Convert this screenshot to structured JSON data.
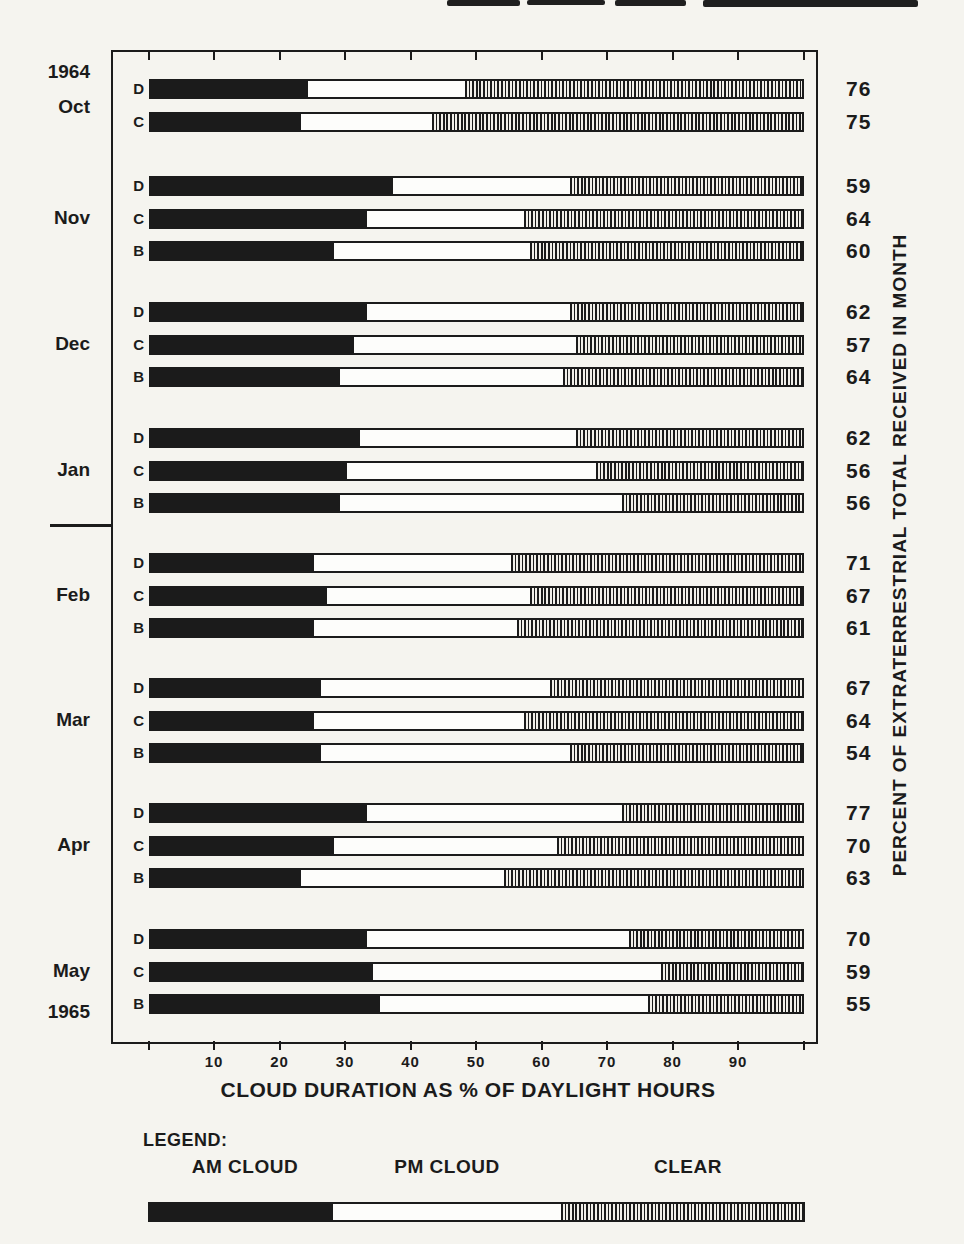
{
  "chart_data": {
    "type": "bar",
    "variant": "horizontal-stacked",
    "unit": "percent of daylight hours",
    "xlabel": "CLOUD DURATION AS % OF DAYLIGHT HOURS",
    "right_axis_label": "PERCENT OF EXTRATERRESTRIAL TOTAL RECEIVED IN MONTH",
    "xlim": [
      0,
      100
    ],
    "x_ticks": [
      10,
      20,
      30,
      40,
      50,
      60,
      70,
      80,
      90
    ],
    "segments": [
      "AM CLOUD",
      "PM CLOUD",
      "CLEAR"
    ],
    "year_start_label": "1964",
    "year_end_label": "1965",
    "groups": [
      {
        "month": "Oct",
        "bars": [
          {
            "site": "D",
            "am_cloud": 24,
            "pm_cloud": 24,
            "clear": 52,
            "percent_received": 76
          },
          {
            "site": "C",
            "am_cloud": 23,
            "pm_cloud": 20,
            "clear": 57,
            "percent_received": 75
          }
        ]
      },
      {
        "month": "Nov",
        "bars": [
          {
            "site": "D",
            "am_cloud": 37,
            "pm_cloud": 27,
            "clear": 36,
            "percent_received": 59
          },
          {
            "site": "C",
            "am_cloud": 33,
            "pm_cloud": 24,
            "clear": 43,
            "percent_received": 64
          },
          {
            "site": "B",
            "am_cloud": 28,
            "pm_cloud": 30,
            "clear": 42,
            "percent_received": 60
          }
        ]
      },
      {
        "month": "Dec",
        "bars": [
          {
            "site": "D",
            "am_cloud": 33,
            "pm_cloud": 31,
            "clear": 36,
            "percent_received": 62
          },
          {
            "site": "C",
            "am_cloud": 31,
            "pm_cloud": 34,
            "clear": 35,
            "percent_received": 57
          },
          {
            "site": "B",
            "am_cloud": 29,
            "pm_cloud": 34,
            "clear": 37,
            "percent_received": 64
          }
        ]
      },
      {
        "month": "Jan",
        "bars": [
          {
            "site": "D",
            "am_cloud": 32,
            "pm_cloud": 33,
            "clear": 35,
            "percent_received": 62
          },
          {
            "site": "C",
            "am_cloud": 30,
            "pm_cloud": 38,
            "clear": 32,
            "percent_received": 56
          },
          {
            "site": "B",
            "am_cloud": 29,
            "pm_cloud": 43,
            "clear": 28,
            "percent_received": 56
          }
        ]
      },
      {
        "month": "Feb",
        "bars": [
          {
            "site": "D",
            "am_cloud": 25,
            "pm_cloud": 30,
            "clear": 45,
            "percent_received": 71
          },
          {
            "site": "C",
            "am_cloud": 27,
            "pm_cloud": 31,
            "clear": 42,
            "percent_received": 67
          },
          {
            "site": "B",
            "am_cloud": 25,
            "pm_cloud": 31,
            "clear": 44,
            "percent_received": 61
          }
        ]
      },
      {
        "month": "Mar",
        "bars": [
          {
            "site": "D",
            "am_cloud": 26,
            "pm_cloud": 35,
            "clear": 39,
            "percent_received": 67
          },
          {
            "site": "C",
            "am_cloud": 25,
            "pm_cloud": 32,
            "clear": 43,
            "percent_received": 64
          },
          {
            "site": "B",
            "am_cloud": 26,
            "pm_cloud": 38,
            "clear": 36,
            "percent_received": 54
          }
        ]
      },
      {
        "month": "Apr",
        "bars": [
          {
            "site": "D",
            "am_cloud": 33,
            "pm_cloud": 39,
            "clear": 28,
            "percent_received": 77
          },
          {
            "site": "C",
            "am_cloud": 28,
            "pm_cloud": 34,
            "clear": 38,
            "percent_received": 70
          },
          {
            "site": "B",
            "am_cloud": 23,
            "pm_cloud": 31,
            "clear": 46,
            "percent_received": 63
          }
        ]
      },
      {
        "month": "May",
        "bars": [
          {
            "site": "D",
            "am_cloud": 33,
            "pm_cloud": 40,
            "clear": 27,
            "percent_received": 70
          },
          {
            "site": "C",
            "am_cloud": 34,
            "pm_cloud": 44,
            "clear": 22,
            "percent_received": 59
          },
          {
            "site": "B",
            "am_cloud": 35,
            "pm_cloud": 41,
            "clear": 24,
            "percent_received": 55
          }
        ]
      }
    ],
    "legend": {
      "title": "LEGEND:",
      "items": [
        {
          "label": "AM CLOUD",
          "value": 28
        },
        {
          "label": "PM CLOUD",
          "value": 35
        },
        {
          "label": "CLEAR",
          "value": 37
        }
      ]
    }
  },
  "colors": {
    "ink": "#1b1b1b",
    "paper": "#f5f4ef",
    "bar_white": "#fdfdfb"
  }
}
